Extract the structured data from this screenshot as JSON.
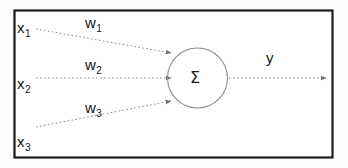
{
  "diagram": {
    "frame": {
      "stroke_color": "#1c1c1c",
      "fill_color": "#ffffff",
      "x": 14,
      "y": 10,
      "width": 319,
      "height": 148
    },
    "background_color": "#fdfdfd",
    "line_color": "#8a8a8a",
    "text_color": "#151515",
    "inputs": [
      {
        "name": "input-x1",
        "base": "x",
        "sub": "1",
        "x": 17,
        "y": 20
      },
      {
        "name": "input-x2",
        "base": "x",
        "sub": "2",
        "x": 17,
        "y": 76
      },
      {
        "name": "input-x3",
        "base": "x",
        "sub": "3",
        "x": 17,
        "y": 134
      }
    ],
    "weights": [
      {
        "name": "weight-w1",
        "base": "w",
        "sub": "1",
        "x": 85,
        "y": 15
      },
      {
        "name": "weight-w2",
        "base": "w",
        "sub": "2",
        "x": 85,
        "y": 57
      },
      {
        "name": "weight-w3",
        "base": "w",
        "sub": "3",
        "x": 85,
        "y": 100
      }
    ],
    "summation": {
      "name": "summation-node",
      "symbol": "Σ",
      "cx": 197.5,
      "cy": 78,
      "r": 30,
      "stroke_color": "#8c8c8c"
    },
    "output": {
      "name": "output-y",
      "label": "y",
      "x": 266,
      "y": 50
    },
    "edges": [
      {
        "name": "edge-x1-to-sum",
        "x1": 36,
        "y1": 29,
        "x2": 171,
        "y2": 53
      },
      {
        "name": "edge-x2-to-sum",
        "x1": 36,
        "y1": 78,
        "x2": 171,
        "y2": 78
      },
      {
        "name": "edge-x3-to-sum",
        "x1": 36,
        "y1": 127,
        "x2": 171,
        "y2": 101
      },
      {
        "name": "edge-sum-to-output",
        "x1": 228,
        "y1": 78,
        "x2": 326,
        "y2": 78
      }
    ]
  }
}
